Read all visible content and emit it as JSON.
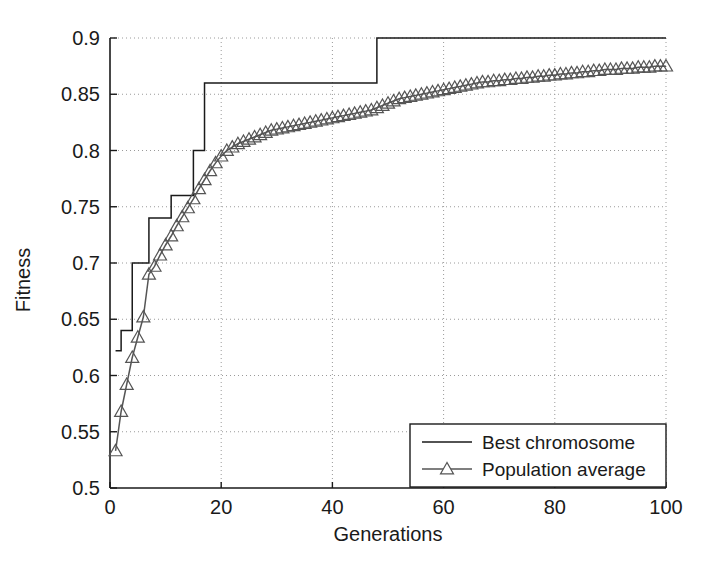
{
  "chart_data": {
    "type": "line",
    "title": "",
    "xlabel": "Generations",
    "ylabel": "Fitness",
    "xlim": [
      0,
      100
    ],
    "ylim": [
      0.5,
      0.9
    ],
    "grid": true,
    "grid_style": "dotted",
    "legend_position": "lower right",
    "xticks": [
      0,
      20,
      40,
      60,
      80,
      100
    ],
    "xtick_labels": [
      "0",
      "20",
      "40",
      "60",
      "80",
      "100"
    ],
    "yticks": [
      0.5,
      0.55,
      0.6,
      0.65,
      0.7,
      0.75,
      0.8,
      0.85,
      0.9
    ],
    "ytick_labels": [
      "0.5",
      "0.55",
      "0.6",
      "0.65",
      "0.7",
      "0.75",
      "0.8",
      "0.85",
      "0.9"
    ],
    "x": [
      1,
      2,
      3,
      4,
      5,
      6,
      7,
      8,
      9,
      10,
      11,
      12,
      13,
      14,
      15,
      16,
      17,
      18,
      19,
      20,
      21,
      22,
      23,
      24,
      25,
      26,
      27,
      28,
      29,
      30,
      31,
      32,
      33,
      34,
      35,
      36,
      37,
      38,
      39,
      40,
      41,
      42,
      43,
      44,
      45,
      46,
      47,
      48,
      49,
      50,
      51,
      52,
      53,
      54,
      55,
      56,
      57,
      58,
      59,
      60,
      61,
      62,
      63,
      64,
      65,
      66,
      67,
      68,
      69,
      70,
      71,
      72,
      73,
      74,
      75,
      76,
      77,
      78,
      79,
      80,
      81,
      82,
      83,
      84,
      85,
      86,
      87,
      88,
      89,
      90,
      91,
      92,
      93,
      94,
      95,
      96,
      97,
      98,
      99,
      100
    ],
    "series": [
      {
        "name": "Best chromosome",
        "style": "step",
        "marker": "none",
        "color": "#1a1a1a",
        "values": [
          0.622,
          0.64,
          0.64,
          0.7,
          0.7,
          0.7,
          0.74,
          0.74,
          0.74,
          0.74,
          0.76,
          0.76,
          0.76,
          0.76,
          0.8,
          0.8,
          0.86,
          0.86,
          0.86,
          0.86,
          0.86,
          0.86,
          0.86,
          0.86,
          0.86,
          0.86,
          0.86,
          0.86,
          0.86,
          0.86,
          0.86,
          0.86,
          0.86,
          0.86,
          0.86,
          0.86,
          0.86,
          0.86,
          0.86,
          0.86,
          0.86,
          0.86,
          0.86,
          0.86,
          0.86,
          0.86,
          0.86,
          0.9,
          0.9,
          0.9,
          0.9,
          0.9,
          0.9,
          0.9,
          0.9,
          0.9,
          0.9,
          0.9,
          0.9,
          0.9,
          0.9,
          0.9,
          0.9,
          0.9,
          0.9,
          0.9,
          0.9,
          0.9,
          0.9,
          0.9,
          0.9,
          0.9,
          0.9,
          0.9,
          0.9,
          0.9,
          0.9,
          0.9,
          0.9,
          0.9,
          0.9,
          0.9,
          0.9,
          0.9,
          0.9,
          0.9,
          0.9,
          0.9,
          0.9,
          0.9,
          0.9,
          0.9,
          0.9,
          0.9,
          0.9,
          0.9,
          0.9,
          0.9,
          0.9,
          0.9
        ]
      },
      {
        "name": "Population average",
        "style": "line",
        "marker": "triangle-up-open",
        "color": "#555555",
        "values": [
          0.533,
          0.568,
          0.592,
          0.616,
          0.634,
          0.652,
          0.69,
          0.697,
          0.707,
          0.716,
          0.724,
          0.733,
          0.741,
          0.749,
          0.757,
          0.766,
          0.774,
          0.782,
          0.789,
          0.795,
          0.8,
          0.803,
          0.806,
          0.808,
          0.81,
          0.812,
          0.814,
          0.816,
          0.818,
          0.819,
          0.82,
          0.821,
          0.822,
          0.823,
          0.824,
          0.825,
          0.826,
          0.827,
          0.828,
          0.829,
          0.83,
          0.831,
          0.832,
          0.833,
          0.834,
          0.835,
          0.836,
          0.838,
          0.84,
          0.842,
          0.844,
          0.846,
          0.847,
          0.848,
          0.849,
          0.85,
          0.851,
          0.852,
          0.853,
          0.854,
          0.855,
          0.856,
          0.857,
          0.858,
          0.859,
          0.86,
          0.861,
          0.861,
          0.862,
          0.862,
          0.863,
          0.863,
          0.864,
          0.864,
          0.865,
          0.865,
          0.866,
          0.866,
          0.867,
          0.867,
          0.868,
          0.868,
          0.869,
          0.869,
          0.87,
          0.87,
          0.871,
          0.871,
          0.872,
          0.872,
          0.872,
          0.873,
          0.873,
          0.873,
          0.874,
          0.874,
          0.874,
          0.875,
          0.875,
          0.875
        ]
      }
    ]
  },
  "legend": {
    "entries": [
      {
        "label": "Best chromosome"
      },
      {
        "label": "Population average"
      }
    ]
  },
  "colors": {
    "axis": "#1a1a1a",
    "grid": "#9a9a9a",
    "series_best": "#1a1a1a",
    "series_average": "#555555",
    "background": "#ffffff"
  }
}
